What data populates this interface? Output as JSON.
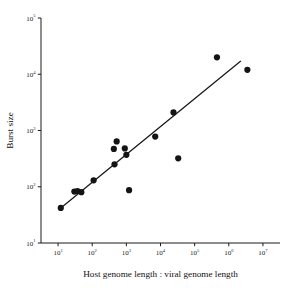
{
  "chart_data": {
    "type": "scatter",
    "title": "",
    "xlabel": "Host genome length : viral genome length",
    "ylabel": "Burst size",
    "xscale": "log",
    "yscale": "log",
    "xlim": [
      3.16,
      31600000
    ],
    "ylim": [
      10,
      100000
    ],
    "grid": false,
    "legend": false,
    "xtick_labels": [
      "10",
      "10",
      "10",
      "10",
      "10",
      "10",
      "10"
    ],
    "xtick_exponents": [
      "1",
      "2",
      "3",
      "4",
      "5",
      "6",
      "7"
    ],
    "xtick_values": [
      10,
      100,
      1000,
      10000,
      100000,
      1000000,
      10000000
    ],
    "ytick_labels": [
      "10",
      "10",
      "10",
      "10",
      "10"
    ],
    "ytick_exponents": [
      "1",
      "2",
      "3",
      "4",
      "5"
    ],
    "ytick_values": [
      10,
      100,
      1000,
      10000,
      100000
    ],
    "points": [
      {
        "x": 12,
        "y": 42
      },
      {
        "x": 30,
        "y": 82
      },
      {
        "x": 37,
        "y": 84
      },
      {
        "x": 48,
        "y": 80
      },
      {
        "x": 110,
        "y": 130
      },
      {
        "x": 430,
        "y": 470
      },
      {
        "x": 450,
        "y": 250
      },
      {
        "x": 520,
        "y": 640
      },
      {
        "x": 900,
        "y": 480
      },
      {
        "x": 1000,
        "y": 370
      },
      {
        "x": 1200,
        "y": 87
      },
      {
        "x": 7000,
        "y": 780
      },
      {
        "x": 24000,
        "y": 2100
      },
      {
        "x": 33000,
        "y": 320
      },
      {
        "x": 450000,
        "y": 20000
      },
      {
        "x": 3500000,
        "y": 12000
      }
    ],
    "fit_line": {
      "x_start": 12,
      "y_start": 42,
      "x_end": 2200000,
      "y_end": 17000
    }
  },
  "colors": {
    "axis": "#1a1a1a",
    "marker": "#141414",
    "line": "#1a1a1a",
    "background": "#ffffff"
  }
}
